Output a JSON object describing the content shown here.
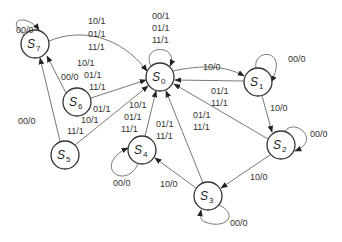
{
  "diagram": {
    "type": "state-transition-diagram",
    "states": [
      {
        "id": "S0",
        "name": "S",
        "sub": "0",
        "x": 160,
        "y": 77
      },
      {
        "id": "S1",
        "name": "S",
        "sub": "1",
        "x": 258,
        "y": 82
      },
      {
        "id": "S2",
        "name": "S",
        "sub": "2",
        "x": 281,
        "y": 145
      },
      {
        "id": "S3",
        "name": "S",
        "sub": "3",
        "x": 208,
        "y": 196
      },
      {
        "id": "S4",
        "name": "S",
        "sub": "4",
        "x": 142,
        "y": 150
      },
      {
        "id": "S5",
        "name": "S",
        "sub": "5",
        "x": 65,
        "y": 155
      },
      {
        "id": "S6",
        "name": "S",
        "sub": "6",
        "x": 77,
        "y": 102
      },
      {
        "id": "S7",
        "name": "S",
        "sub": "7",
        "x": 35,
        "y": 44
      }
    ],
    "transitions": [
      {
        "from": "S0",
        "to": "S0",
        "labels": [
          "00/1",
          "01/1",
          "11/1"
        ]
      },
      {
        "from": "S0",
        "to": "S1",
        "labels": [
          "10/0"
        ]
      },
      {
        "from": "S1",
        "to": "S1",
        "labels": [
          "00/0"
        ]
      },
      {
        "from": "S1",
        "to": "S0",
        "labels": [
          "01/1",
          "11/1"
        ]
      },
      {
        "from": "S1",
        "to": "S2",
        "labels": [
          "10/0"
        ]
      },
      {
        "from": "S2",
        "to": "S2",
        "labels": [
          "00/0"
        ]
      },
      {
        "from": "S2",
        "to": "S0",
        "labels": [
          "01/1",
          "11/1"
        ]
      },
      {
        "from": "S2",
        "to": "S3",
        "labels": [
          "10/0"
        ]
      },
      {
        "from": "S3",
        "to": "S3",
        "labels": [
          "00/0"
        ]
      },
      {
        "from": "S3",
        "to": "S0",
        "labels": [
          "01/1",
          "11/1"
        ]
      },
      {
        "from": "S3",
        "to": "S4",
        "labels": [
          "10/0"
        ]
      },
      {
        "from": "S4",
        "to": "S4",
        "labels": [
          "00/0"
        ]
      },
      {
        "from": "S4",
        "to": "S0",
        "labels": [
          "10/1",
          "01/1",
          "11/1"
        ]
      },
      {
        "from": "S5",
        "to": "S0",
        "labels": [
          "01/1",
          "10/1",
          "11/1"
        ]
      },
      {
        "from": "S5",
        "to": "S7",
        "labels": [
          "00/0"
        ]
      },
      {
        "from": "S6",
        "to": "S0",
        "labels": [
          "10/1",
          "01/1",
          "11/1"
        ]
      },
      {
        "from": "S6",
        "to": "S7",
        "labels": [
          "00/0"
        ]
      },
      {
        "from": "S7",
        "to": "S7",
        "labels": [
          "00/0"
        ]
      },
      {
        "from": "S7",
        "to": "S0",
        "labels": [
          "10/1",
          "01/1",
          "11/1"
        ]
      }
    ],
    "text": {
      "s0_self": [
        "00/1",
        "01/1",
        "11/1"
      ],
      "s0_to_s1": "10/0",
      "s1_self": "00/0",
      "s1_to_s0": [
        "01/1",
        "11/1"
      ],
      "s1_to_s2": "10/0",
      "s2_self": "00/0",
      "s2_to_s0": [
        "01/1",
        "11/1"
      ],
      "s2_to_s3": "10/0",
      "s3_self": "00/0",
      "s3_to_s0": [
        "01/1",
        "11/1"
      ],
      "s3_to_s4": "10/0",
      "s4_self": "00/0",
      "s4_to_s0": [
        "10/1",
        "01/1",
        "11/1"
      ],
      "s5_to_s0": [
        "01/1",
        "10/1",
        "11/1"
      ],
      "s5_to_s7": "00/0",
      "s6_to_s0": [
        "10/1",
        "01/1",
        "11/1"
      ],
      "s6_to_s7": "00/0",
      "s7_self": "00/0",
      "s7_to_s0": [
        "10/1",
        "01/1",
        "11/1"
      ]
    }
  }
}
